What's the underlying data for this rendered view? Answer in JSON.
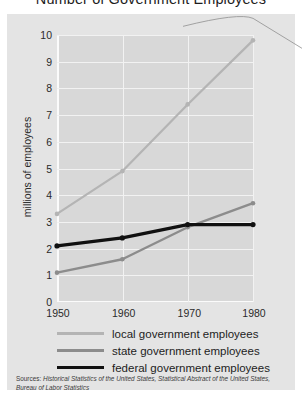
{
  "title": "Number of Government Employees",
  "axes": {
    "ylabel": "millions of employees",
    "yticks": [
      "10",
      "9",
      "8",
      "7",
      "6",
      "5",
      "4",
      "3",
      "2",
      "1",
      "0"
    ],
    "xticks": [
      "1950",
      "1960",
      "1970",
      "1980"
    ]
  },
  "legend": [
    {
      "key": "local",
      "label": "local government employees",
      "color": "#b4b4b4"
    },
    {
      "key": "state",
      "label": "state government employees",
      "color": "#8c8c8c"
    },
    {
      "key": "federal",
      "label": "federal government employees",
      "color": "#111111"
    }
  ],
  "sources": {
    "prefix": "Sources:",
    "text": " Historical Statistics of the United States, Statistical Abstract of the United States, Bureau of Labor Statistics"
  },
  "chart_data": {
    "type": "line",
    "title": "Number of Government Employees",
    "xlabel": "",
    "ylabel": "millions of employees",
    "x": [
      1950,
      1960,
      1970,
      1980
    ],
    "xlim": [
      1950,
      1980
    ],
    "ylim": [
      0,
      10
    ],
    "grid": true,
    "legend_position": "bottom",
    "series": [
      {
        "name": "local government employees",
        "color": "#b4b4b4",
        "values": [
          3.3,
          4.9,
          7.4,
          9.8
        ]
      },
      {
        "name": "state government employees",
        "color": "#8c8c8c",
        "values": [
          1.1,
          1.6,
          2.8,
          3.7
        ]
      },
      {
        "name": "federal government employees",
        "color": "#111111",
        "values": [
          2.1,
          2.4,
          2.9,
          2.9
        ]
      }
    ],
    "annotation": {
      "type": "leader-line",
      "from_point": [
        1980,
        9.8
      ]
    }
  }
}
